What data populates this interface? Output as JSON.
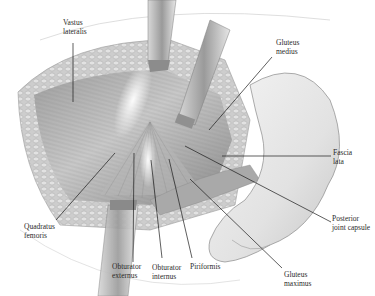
{
  "figure": {
    "labels": [
      {
        "id": "vastus-lateralis",
        "line1": "Vastus",
        "line2": "lateralis",
        "x": 63,
        "y": 22
      },
      {
        "id": "gluteus-medius",
        "line1": "Gluteus",
        "line2": "medius",
        "x": 276,
        "y": 39
      },
      {
        "id": "fascia-lata",
        "line1": "Fascia",
        "line2": "lata",
        "x": 333,
        "y": 147
      },
      {
        "id": "posterior-joint-capsule",
        "line1": "Posterior",
        "line2": "joint capsule",
        "x": 332,
        "y": 215
      },
      {
        "id": "gluteus-maximus",
        "line1": "Gluteus",
        "line2": "maximus",
        "x": 284,
        "y": 271
      },
      {
        "id": "piriformis",
        "line1": "Piriformis",
        "line2": "",
        "x": 190,
        "y": 263
      },
      {
        "id": "obturator-internus",
        "line1": "Obturator",
        "line2": "internus",
        "x": 152,
        "y": 264
      },
      {
        "id": "obturator-externus",
        "line1": "Obturator",
        "line2": "externus",
        "x": 112,
        "y": 262
      },
      {
        "id": "quadratus-femoris",
        "line1": "Quadratus",
        "line2": "femoris",
        "x": 24,
        "y": 222
      }
    ],
    "colors": {
      "background": "#ffffff",
      "muscle": "#b9b9b9",
      "muscle_dark": "#8e8e8e",
      "fat": "#cfcfcf",
      "bone": "#e6e6e6",
      "retractor": "#a8a8a8",
      "leader": "#1a1a1a",
      "text": "#2a2a2a"
    }
  }
}
